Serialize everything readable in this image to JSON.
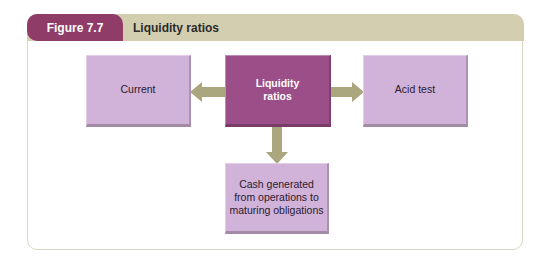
{
  "figure": {
    "number_label": "Figure 7.7",
    "title": "Liquidity ratios"
  },
  "diagram": {
    "center": {
      "label_line1": "Liquidity",
      "label_line2": "ratios"
    },
    "left": {
      "label": "Current"
    },
    "right": {
      "label": "Acid test"
    },
    "bottom": {
      "label_line1": "Cash generated",
      "label_line2": "from operations to",
      "label_line3": "maturing obligations"
    },
    "arrows": [
      {
        "from": "Liquidity ratios",
        "to": "Current",
        "direction": "left"
      },
      {
        "from": "Liquidity ratios",
        "to": "Acid test",
        "direction": "right"
      },
      {
        "from": "Liquidity ratios",
        "to": "Cash generated from operations to maturing obligations",
        "direction": "down"
      }
    ]
  },
  "colors": {
    "figure_tag": "#8f3d68",
    "header_bar": "#d3ceb0",
    "center_box": "#9b4e87",
    "outer_box": "#d1b2d8",
    "arrow": "#aaa67e",
    "frame_border": "#d8d6c4"
  }
}
